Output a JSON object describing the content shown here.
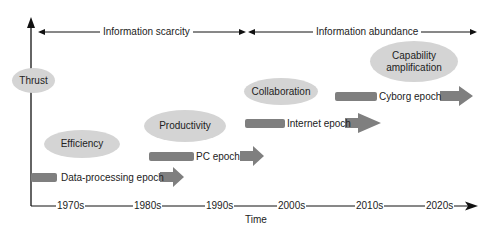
{
  "diagram": {
    "top_ranges": [
      {
        "label": "Information scarcity"
      },
      {
        "label": "Information abundance"
      }
    ],
    "y_axis_label": "Thrust",
    "x_axis_label": "Time",
    "x_ticks": [
      "1970s",
      "1980s",
      "1990s",
      "2000s",
      "2010s",
      "2020s"
    ],
    "thrusts": [
      {
        "label": "Efficiency"
      },
      {
        "label": "Productivity"
      },
      {
        "label": "Collaboration"
      },
      {
        "label": "Capability amplification"
      }
    ],
    "epochs": [
      {
        "label": "Data-processing epoch"
      },
      {
        "label": "PC epoch"
      },
      {
        "label": "Internet epoch"
      },
      {
        "label": "Cyborg epoch"
      }
    ],
    "colors": {
      "ellipse_fill": "#d4d4d4",
      "arrow_fill": "#7f7f7f",
      "line": "#111111"
    }
  }
}
